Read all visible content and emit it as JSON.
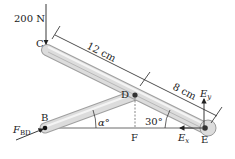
{
  "diagram": {
    "type": "frame-statics",
    "colors": {
      "member_fill": "#d9d9d9",
      "member_edge": "#9a9a9a",
      "line": "#222222",
      "pin": "#333333"
    },
    "load": {
      "label": "200 N",
      "point": "C"
    },
    "points": {
      "C": {
        "label": "C"
      },
      "D": {
        "label": "D"
      },
      "B": {
        "label": "B"
      },
      "E": {
        "label": "E"
      },
      "F": {
        "label": "F"
      }
    },
    "dimensions": [
      {
        "label": "12 cm",
        "from": "C",
        "to": "D"
      },
      {
        "label": "8 cm",
        "from": "D",
        "to": "E"
      }
    ],
    "angles": [
      {
        "label": "α°",
        "at": "B"
      },
      {
        "label": "30°",
        "at": "E"
      }
    ],
    "reactions": {
      "Ey": {
        "main": "E",
        "sub": "y"
      },
      "Ex": {
        "main": "E",
        "sub": "x"
      },
      "FBD": {
        "main": "F",
        "sub": "BD"
      }
    }
  }
}
